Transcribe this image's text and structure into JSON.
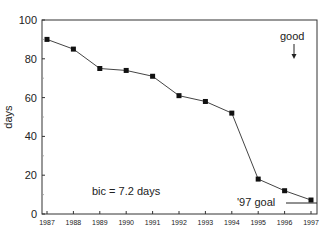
{
  "chart_data": {
    "type": "line",
    "title": "",
    "xlabel": "",
    "ylabel": "days",
    "x": [
      "1987",
      "1988",
      "1989",
      "1990",
      "1991",
      "1992",
      "1993",
      "1994",
      "1995",
      "1996",
      "1997"
    ],
    "series": [
      {
        "name": "days",
        "values": [
          90,
          85,
          75,
          74,
          71,
          61,
          58,
          52,
          18,
          12,
          7.2
        ],
        "marker": "square"
      }
    ],
    "ylim": [
      0,
      100
    ],
    "yticks": [
      0,
      20,
      40,
      60,
      80,
      100
    ],
    "grid": false,
    "legend": null,
    "annotations": [
      {
        "text": "bic = 7.2 days",
        "position": "lower-left"
      },
      {
        "text": "good",
        "arrow": "down",
        "position": "upper-right"
      },
      {
        "text": "'97 goal",
        "type": "reference-line",
        "value": 5.5,
        "position": "lower-right"
      }
    ]
  },
  "labels": {
    "ylabel": "days",
    "bic": "bic = 7.2 days",
    "good": "good",
    "goal": "'97 goal"
  }
}
